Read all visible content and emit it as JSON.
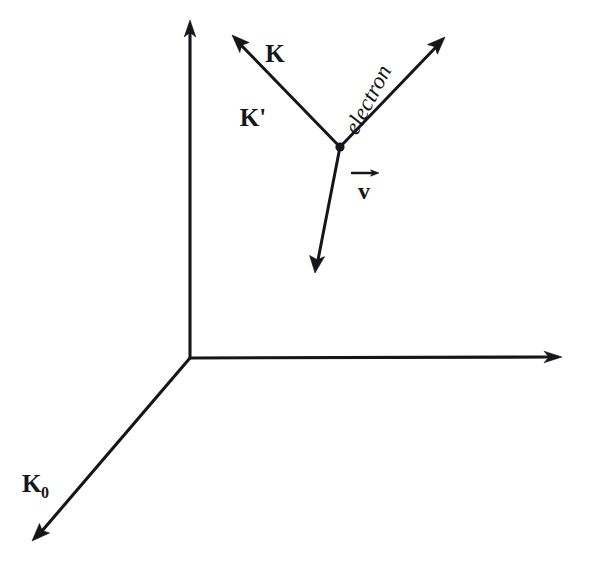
{
  "figure": {
    "background_color": "#ffffff",
    "ink_color": "#16161a",
    "width": 590,
    "height": 570
  },
  "labels": {
    "k_incident": "K",
    "k_scattered": "K'",
    "k_zero": "K",
    "k_zero_subscript": "0",
    "electron": "electron",
    "velocity": "v"
  },
  "axes": [
    {
      "name": "vertical-axis",
      "from": [
        190,
        358
      ],
      "to": [
        190,
        22
      ],
      "arrowhead": "end",
      "label": ""
    },
    {
      "name": "horizontal-axis",
      "from": [
        190,
        358
      ],
      "to": [
        560,
        358
      ],
      "arrowhead": "end",
      "label": ""
    },
    {
      "name": "depth-axis",
      "from": [
        190,
        358
      ],
      "to": [
        33,
        540
      ],
      "arrowhead": "end",
      "label": "K0"
    }
  ],
  "vectors": [
    {
      "name": "k-prime-vector",
      "from": [
        340,
        147
      ],
      "to": [
        233,
        36
      ],
      "arrowhead": "end",
      "labels": [
        "K",
        "K'"
      ]
    },
    {
      "name": "electron-vector",
      "from": [
        340,
        147
      ],
      "to": [
        444,
        38
      ],
      "arrowhead": "end",
      "labels": [
        "electron"
      ]
    },
    {
      "name": "velocity-vector",
      "from": [
        340,
        147
      ],
      "to": [
        315,
        272
      ],
      "arrowhead": "end",
      "labels": [
        "v"
      ]
    }
  ],
  "vertex": {
    "name": "scattering-vertex",
    "position": [
      340,
      147
    ]
  }
}
